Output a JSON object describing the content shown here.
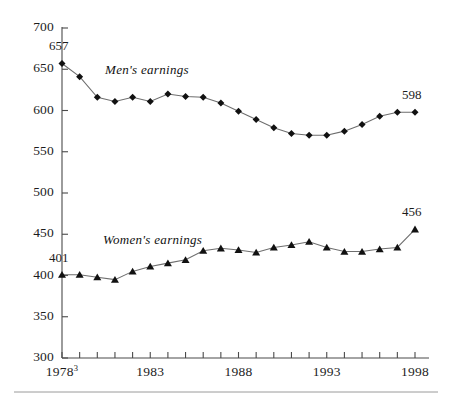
{
  "chart_data": {
    "type": "line",
    "title": "",
    "subtitle": "",
    "xlabel": "",
    "ylabel": "",
    "x": [
      1978,
      1979,
      1980,
      1981,
      1982,
      1983,
      1984,
      1985,
      1986,
      1987,
      1988,
      1989,
      1990,
      1991,
      1992,
      1993,
      1994,
      1995,
      1996,
      1997,
      1998
    ],
    "xlim": [
      1978,
      1998
    ],
    "ylim": [
      300,
      700
    ],
    "yticks": [
      300,
      350,
      400,
      450,
      500,
      550,
      600,
      650,
      700
    ],
    "xtick_labels": [
      {
        "x": 1978,
        "label": "1978",
        "superscript": "3"
      },
      {
        "x": 1983,
        "label": "1983",
        "superscript": ""
      },
      {
        "x": 1988,
        "label": "1988",
        "superscript": ""
      },
      {
        "x": 1993,
        "label": "1993",
        "superscript": ""
      },
      {
        "x": 1998,
        "label": "1998",
        "superscript": ""
      }
    ],
    "grid": false,
    "legend_position": "inline-annotation",
    "series": [
      {
        "name": "Men's earnings",
        "marker": "diamond",
        "label_text": "Men's earnings",
        "values": [
          657,
          641,
          616,
          611,
          616,
          611,
          620,
          617,
          616,
          609,
          599,
          589,
          579,
          572,
          570,
          570,
          575,
          583,
          593,
          598,
          598
        ]
      },
      {
        "name": "Women's earnings",
        "marker": "triangle",
        "label_text": "Women's earnings",
        "values": [
          401,
          401,
          398,
          395,
          405,
          411,
          415,
          419,
          430,
          433,
          431,
          428,
          434,
          437,
          441,
          434,
          429,
          429,
          432,
          434,
          456
        ]
      }
    ],
    "annotations": [
      {
        "text": "657",
        "x": 1978,
        "y": 657,
        "series": "Men's earnings",
        "position": "above"
      },
      {
        "text": "598",
        "x": 1998,
        "y": 598,
        "series": "Men's earnings",
        "position": "above"
      },
      {
        "text": "401",
        "x": 1978,
        "y": 401,
        "series": "Women's earnings",
        "position": "above"
      },
      {
        "text": "456",
        "x": 1998,
        "y": 456,
        "series": "Women's earnings",
        "position": "above"
      }
    ],
    "colors": {
      "line": "#6e6e6e",
      "marker": "#111111",
      "axis": "#4a4a4a",
      "text": "#1c1c1c",
      "background": "#ffffff"
    }
  },
  "footer": {
    "rule": true
  }
}
